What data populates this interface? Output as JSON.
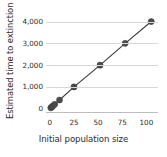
{
  "chart_data": {
    "type": "scatter",
    "title": "",
    "xlabel": "Initial population size",
    "ylabel": "Estimated time to extinction (95%)",
    "xlim": [
      -4,
      112
    ],
    "ylim": [
      -150,
      4300
    ],
    "xticks": [
      "0",
      "25",
      "50",
      "75",
      "100"
    ],
    "xtick_values": [
      0,
      25,
      50,
      75,
      100
    ],
    "yticks": [
      "0",
      "1,000",
      "2,000",
      "3,000",
      "4,000"
    ],
    "ytick_values": [
      0,
      1000,
      2000,
      3000,
      4000
    ],
    "grid": "horizontal",
    "legend": "none",
    "marker_color": "#4a4a4a",
    "line_color": "#3a3a3a",
    "gridline_color": "#d8d8d8",
    "axis_color": "#bdbdbd",
    "series": [
      {
        "name": "Estimated time to extinction",
        "x": [
          1,
          2,
          3,
          5,
          10,
          25,
          52,
          78,
          105
        ],
        "y": [
          40,
          80,
          120,
          200,
          400,
          1000,
          2000,
          3000,
          4000
        ]
      }
    ]
  }
}
